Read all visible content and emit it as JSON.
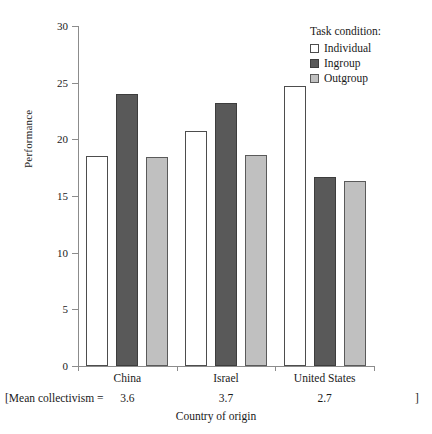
{
  "chart_data": {
    "type": "bar",
    "title": "",
    "xlabel": "Country of origin",
    "ylabel": "Performance",
    "ylim": [
      0,
      30
    ],
    "yticks": [
      0,
      5,
      10,
      15,
      20,
      25,
      30
    ],
    "grid": false,
    "legend_position": "top-right",
    "legend_title": "Task condition:",
    "categories": [
      "China",
      "Israel",
      "United States"
    ],
    "series": [
      {
        "name": "Individual",
        "color": "#ffffff",
        "values": [
          18.5,
          20.7,
          24.7
        ]
      },
      {
        "name": "Ingroup",
        "color": "#595959",
        "values": [
          24.0,
          23.2,
          16.7
        ]
      },
      {
        "name": "Outgroup",
        "color": "#c0c0c0",
        "values": [
          18.4,
          18.6,
          16.3
        ]
      }
    ],
    "annotation": {
      "prefix": "[Mean collectivism =",
      "values": [
        "3.6",
        "3.7",
        "2.7"
      ],
      "suffix": "]"
    }
  },
  "axis": {
    "y_title": "Performance",
    "x_title": "Country of origin",
    "y_tick_labels": [
      "0",
      "5",
      "10",
      "15",
      "20",
      "25",
      "30"
    ]
  },
  "legend": {
    "title": "Task condition:",
    "items": [
      {
        "label": "Individual",
        "swatch": "cond-individual"
      },
      {
        "label": "Ingroup",
        "swatch": "cond-ingroup"
      },
      {
        "label": "Outgroup",
        "swatch": "cond-outgroup"
      }
    ]
  }
}
